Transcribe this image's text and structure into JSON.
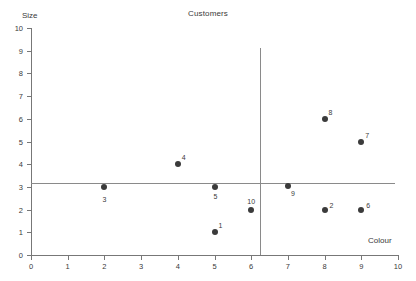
{
  "chart_data": {
    "type": "scatter",
    "title": "Customers",
    "xlabel": "Colour",
    "ylabel": "Size",
    "xlim": [
      0,
      10
    ],
    "ylim": [
      0,
      10
    ],
    "grid": false,
    "legend": null,
    "x_ticks": [
      "0",
      "1",
      "2",
      "3",
      "4",
      "5",
      "6",
      "7",
      "8",
      "9",
      "10"
    ],
    "y_ticks": [
      "0",
      "1",
      "2",
      "3",
      "4",
      "5",
      "6",
      "7",
      "8",
      "9",
      "10"
    ],
    "marker_color": "#3b3b3b",
    "axis_color": "#777777",
    "refline_color": "#8a8a8a",
    "points": [
      {
        "label": "3",
        "x": 2,
        "y": 3.0,
        "label_pos": "below"
      },
      {
        "label": "4",
        "x": 4,
        "y": 4.0,
        "label_pos": "upper-right"
      },
      {
        "label": "5",
        "x": 5,
        "y": 3.0,
        "label_pos": "below-left"
      },
      {
        "label": "1",
        "x": 5,
        "y": 1.0,
        "label_pos": "upper-right"
      },
      {
        "label": "10",
        "x": 6,
        "y": 2.0,
        "label_pos": "above"
      },
      {
        "label": "9",
        "x": 7,
        "y": 3.05,
        "label_pos": "below-right"
      },
      {
        "label": "2",
        "x": 8,
        "y": 2.0,
        "label_pos": "right"
      },
      {
        "label": "8",
        "x": 8,
        "y": 6.0,
        "label_pos": "upper-right"
      },
      {
        "label": "6",
        "x": 9,
        "y": 2.0,
        "label_pos": "right"
      },
      {
        "label": "7",
        "x": 9,
        "y": 5.0,
        "label_pos": "upper-right"
      }
    ],
    "reference_lines": [
      {
        "orientation": "horizontal",
        "value": 3.15,
        "x_from": 0,
        "x_to": 9.92
      },
      {
        "orientation": "vertical",
        "value": 6.25,
        "y_from": 0,
        "y_to": 9.1
      }
    ]
  }
}
